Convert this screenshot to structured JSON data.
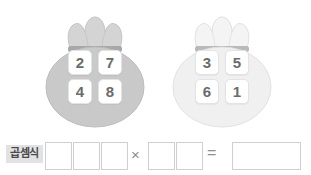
{
  "background_color": "#ffffff",
  "bags": [
    {
      "name": "left-bag",
      "body_color": "#c9c9c9",
      "top_color": "#d4d4d4",
      "band_color": "#a8a8a8",
      "tiles": [
        "2",
        "7",
        "4",
        "8"
      ]
    },
    {
      "name": "right-bag",
      "body_color": "#f0f0f0",
      "top_color": "#f4f4f4",
      "band_color": "#b9b9b9",
      "tiles": [
        "3",
        "5",
        "6",
        "1"
      ]
    }
  ],
  "answer_row": {
    "label": "곱셈식",
    "label_bg_color": "#e2e2e2",
    "multiplicand_boxes": [
      "",
      "",
      ""
    ],
    "multiplier_boxes": [
      "",
      ""
    ],
    "times_symbol": "×",
    "equals_symbol": "=",
    "result_box": ""
  }
}
